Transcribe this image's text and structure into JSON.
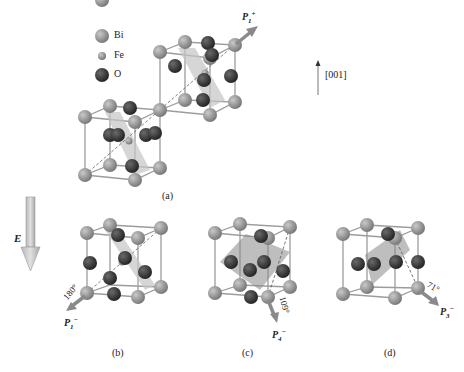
{
  "legend": {
    "items": [
      {
        "label": "Bi",
        "color": "#8f8f8f",
        "r": 7
      },
      {
        "label": "Fe",
        "color": "#9a9a9a",
        "r": 4
      },
      {
        "label": "O",
        "color": "#3a3a3a",
        "r": 7
      }
    ]
  },
  "direction": {
    "label": "[001]"
  },
  "field": {
    "label": "E"
  },
  "panels": {
    "a": {
      "caption": "(a)",
      "polarization": "P",
      "pol_sub": "1",
      "pol_sup": "+"
    },
    "b": {
      "caption": "(b)",
      "polarization": "P",
      "pol_sub": "1",
      "pol_sup": "−",
      "angle": "180°"
    },
    "c": {
      "caption": "(c)",
      "polarization": "P",
      "pol_sub": "4",
      "pol_sup": "−",
      "angle": "109°"
    },
    "d": {
      "caption": "(d)",
      "polarization": "P",
      "pol_sub": "3",
      "pol_sup": "−",
      "angle": "71°"
    }
  },
  "colors": {
    "bi": "#8f8f8f",
    "o": "#3a3a3a",
    "edge": "#9c9c9c",
    "plane": "#c4c4c4",
    "arrow": "#8a8a8a"
  }
}
